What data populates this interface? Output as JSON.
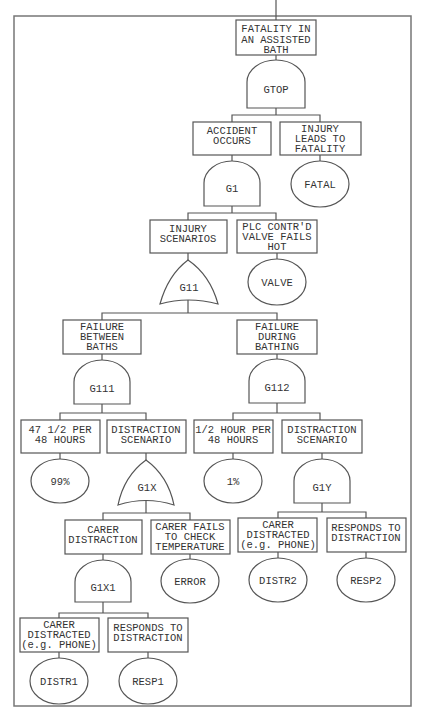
{
  "events": {
    "top": {
      "lines": [
        "FATALITY IN",
        "AN ASSISTED",
        "BATH"
      ]
    },
    "accident": {
      "lines": [
        "ACCIDENT",
        "OCCURS"
      ]
    },
    "injury_fatal": {
      "lines": [
        "INJURY",
        "LEADS TO",
        "FATALITY"
      ]
    },
    "injury_scen": {
      "lines": [
        "INJURY",
        "SCENARIOS"
      ]
    },
    "plc_valve": {
      "lines": [
        "PLC CONTR'D",
        "VALVE FAILS",
        "HOT"
      ]
    },
    "fail_between": {
      "lines": [
        "FAILURE",
        "BETWEEN",
        "BATHS"
      ]
    },
    "fail_during": {
      "lines": [
        "FAILURE",
        "DURING",
        "BATHING"
      ]
    },
    "per47": {
      "lines": [
        "47 1/2 PER",
        "48 HOURS"
      ]
    },
    "distr_scen_x": {
      "lines": [
        "DISTRACTION",
        "SCENARIO"
      ]
    },
    "half_hour": {
      "lines": [
        "1/2 HOUR PER",
        "48 HOURS"
      ]
    },
    "distr_scen_y": {
      "lines": [
        "DISTRACTION",
        "SCENARIO"
      ]
    },
    "carer_distraction": {
      "lines": [
        "CARER",
        "DISTRACTION"
      ]
    },
    "carer_fails": {
      "lines": [
        "CARER FAILS",
        "TO CHECK",
        "TEMPERATURE"
      ]
    },
    "carer_distracted_2": {
      "lines": [
        "CARER",
        "DISTRACTED",
        "(e.g. PHONE)"
      ]
    },
    "responds_2": {
      "lines": [
        "RESPONDS TO",
        "DISTRACTION"
      ]
    },
    "carer_distracted_1": {
      "lines": [
        "CARER",
        "DISTRACTED",
        "(e.g. PHONE)"
      ]
    },
    "responds_1": {
      "lines": [
        "RESPONDS TO",
        "DISTRACTION"
      ]
    }
  },
  "gates": {
    "gtop": {
      "label": "GTOP",
      "type": "AND"
    },
    "g1": {
      "label": "G1",
      "type": "AND"
    },
    "g11": {
      "label": "G11",
      "type": "OR"
    },
    "g111": {
      "label": "G111",
      "type": "AND"
    },
    "g112": {
      "label": "G112",
      "type": "AND"
    },
    "g1x": {
      "label": "G1X",
      "type": "OR"
    },
    "g1y": {
      "label": "G1Y",
      "type": "AND"
    },
    "g1x1": {
      "label": "G1X1",
      "type": "AND"
    }
  },
  "basic": {
    "fatal": "FATAL",
    "valve": "VALVE",
    "p99": "99%",
    "p1": "1%",
    "error": "ERROR",
    "distr2": "DISTR2",
    "resp2": "RESP2",
    "distr1": "DISTR1",
    "resp1": "RESP1"
  }
}
